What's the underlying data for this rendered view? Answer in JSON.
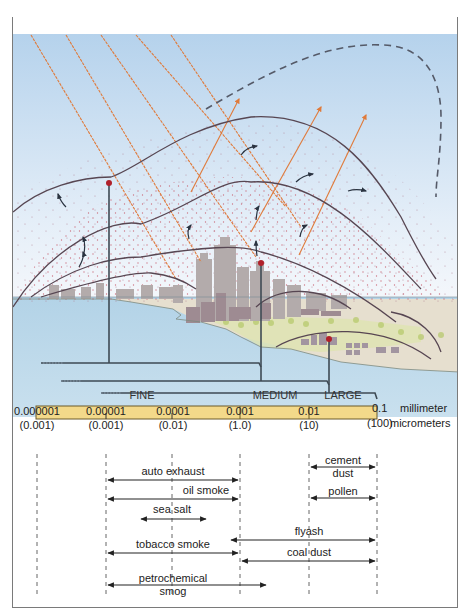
{
  "figure": {
    "colors": {
      "sky_top": "#b7d3ec",
      "sky_bottom": "#e8f1f9",
      "water": "#b8d6e8",
      "land": "#e3dccc",
      "vegetation": "#c8d27a",
      "buildings": "#a99e9e",
      "plume_lines": "#5a4a55",
      "radiation": "#e07a3a",
      "particles": "#c86070",
      "band_fill": "#f3d98a",
      "band_border": "#6b5a2a",
      "marker": "#b0202a"
    }
  },
  "size_scale": {
    "bands": [
      {
        "label": "FINE"
      },
      {
        "label": "MEDIUM"
      },
      {
        "label": "LARGE"
      }
    ],
    "ticks": [
      {
        "mm": "0.000001",
        "um": "(0.001)"
      },
      {
        "mm": "0.00001",
        "um": "(0.001)"
      },
      {
        "mm": "0.0001",
        "um": "(0.01)"
      },
      {
        "mm": "0.001",
        "um": "(1.0)"
      },
      {
        "mm": "0.01",
        "um": "(10)"
      },
      {
        "mm": "0.1",
        "um": "(100)"
      }
    ],
    "unit_mm": "millimeter",
    "unit_um": "micrometers"
  },
  "particles": [
    {
      "label": "cement dust",
      "label_line1": "cement",
      "label_line2": "dust",
      "from": "0.01",
      "to": "0.1"
    },
    {
      "label": "auto exhaust",
      "from": "0.00001",
      "to": "0.001"
    },
    {
      "label": "oil smoke",
      "from": "0.00001",
      "to": "0.001"
    },
    {
      "label": "pollen",
      "from": "0.01",
      "to": "0.1"
    },
    {
      "label": "sea salt",
      "from": "0.00003",
      "to": "0.0003"
    },
    {
      "label": "flyash",
      "from": "0.0008",
      "to": "0.1"
    },
    {
      "label": "tobacco smoke",
      "from": "0.00001",
      "to": "0.001"
    },
    {
      "label": "coal dust",
      "from": "0.001",
      "to": "0.1"
    },
    {
      "label": "petrochemical smog",
      "label_line1": "petrochemical",
      "label_line2": "smog",
      "from": "0.00001",
      "to": "0.003"
    }
  ]
}
